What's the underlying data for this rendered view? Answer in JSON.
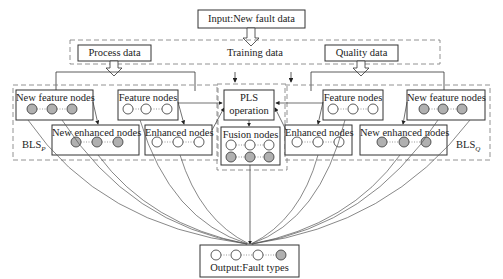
{
  "diagram": {
    "input_box": "Input:New fault data",
    "training_data": "Training data",
    "process_data": "Process data",
    "quality_data": "Quality data",
    "bls_p": {
      "label": "BLS",
      "subscript": "P",
      "new_feature_nodes": "New feature nodes",
      "feature_nodes": "Feature nodes",
      "new_enhanced_nodes": "New enhanced nodes",
      "enhanced_nodes": "Enhanced nodes"
    },
    "bls_q": {
      "label": "BLS",
      "subscript": "Q",
      "new_feature_nodes": "New feature nodes",
      "feature_nodes": "Feature nodes",
      "new_enhanced_nodes": "New enhanced nodes",
      "enhanced_nodes": "Enhanced nodes"
    },
    "pls_operation_line1": "PLS",
    "pls_operation_line2": "operation",
    "fusion_nodes": "Fusion nodes",
    "output_box": "Output:Fault types",
    "colors": {
      "stroke": "#333333",
      "dashed": "#777777",
      "filled_node": "#b0b0b0",
      "empty_node": "#ffffff"
    }
  }
}
